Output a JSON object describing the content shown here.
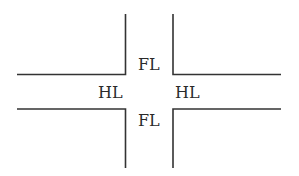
{
  "diagram": {
    "type": "road-intersection",
    "line_color": "#333333",
    "labels": {
      "fl_top": "FL",
      "fl_bottom": "FL",
      "hl_left": "HL",
      "hl_right": "HL"
    }
  }
}
